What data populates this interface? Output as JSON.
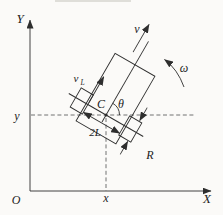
{
  "diagram": {
    "labels": {
      "axis_y": "Y",
      "axis_x": "X",
      "origin": "O",
      "coord_y": "y",
      "coord_x": "x",
      "velocity": "v",
      "angular_velocity": "ω",
      "left_wheel_velocity_base": "v",
      "left_wheel_velocity_sub": "L",
      "center_point": "C",
      "heading_angle": "θ",
      "wheel_track": "2L",
      "wheel_radius": "R"
    },
    "colors": {
      "stroke": "#2e2e2e",
      "dashed_line": "#4f4f4f",
      "text": "#1c1c1c",
      "background": "#fbfaf8"
    }
  }
}
